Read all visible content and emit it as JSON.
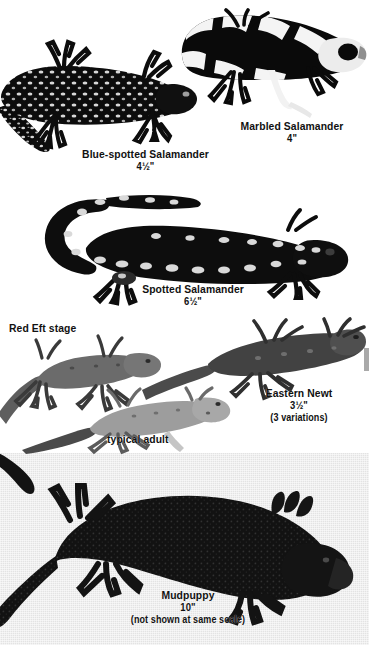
{
  "plate": {
    "title": "Salamanders identification plate",
    "background_color": "#ffffff",
    "panel_color": "#e3e3e3",
    "text_color": "#111111"
  },
  "specimens": [
    {
      "id": "blue-spotted-salamander",
      "name": "Blue-spotted Salamander",
      "size": "4½\"",
      "note": "",
      "pose": "dark body with pale blue flecks, tail to lower-left, head to right"
    },
    {
      "id": "marbled-salamander",
      "name": "Marbled Salamander",
      "size": "4\"",
      "note": "",
      "pose": "black body with bold white crossbands, head to right"
    },
    {
      "id": "spotted-salamander",
      "name": "Spotted Salamander",
      "size": "6½\"",
      "note": "",
      "pose": "black body with two rows of yellow spots, curved tail to left, head to right"
    },
    {
      "id": "eastern-newt",
      "name": "Eastern Newt",
      "size": "3½\"",
      "note": "(3 variations)",
      "pose": "three specimens shown",
      "variations": [
        {
          "id": "red-eft",
          "caption": "Red Eft stage"
        },
        {
          "id": "adult-dark",
          "caption": ""
        },
        {
          "id": "typical-adult",
          "caption": "typical adult"
        }
      ]
    },
    {
      "id": "mudpuppy",
      "name": "Mudpuppy",
      "size": "10\"",
      "note": "(not shown at same scale)",
      "pose": "large dark aquatic salamander with external gills, head to right, on gray panel"
    }
  ],
  "captions": {
    "red_eft_stage": "Red Eft stage",
    "typical_adult": "typical adult"
  }
}
